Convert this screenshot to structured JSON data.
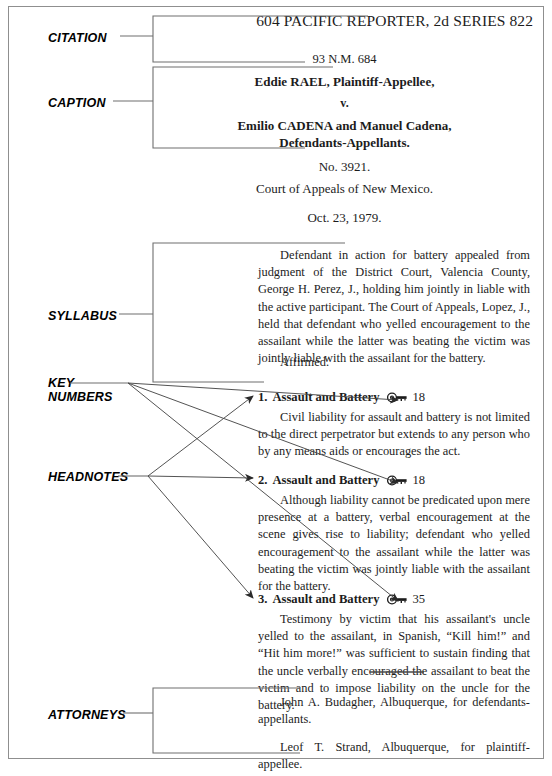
{
  "annotations": [
    {
      "id": "citation",
      "label": "CITATION",
      "x": 48,
      "y": 31
    },
    {
      "id": "caption",
      "label": "CAPTION",
      "x": 48,
      "y": 96
    },
    {
      "id": "syllabus",
      "label": "SYLLABUS",
      "x": 48,
      "y": 309
    },
    {
      "id": "key-numbers",
      "label": "KEY\nNUMBERS",
      "x": 48,
      "y": 376
    },
    {
      "id": "headnotes",
      "label": "HEADNOTES",
      "x": 48,
      "y": 470
    },
    {
      "id": "attorneys",
      "label": "ATTORNEYS",
      "x": 48,
      "y": 708
    }
  ],
  "citation": {
    "running_head": "604 PACIFIC REPORTER, 2d SERIES  822",
    "reporter_volume": "604",
    "reporter_name": "PACIFIC REPORTER, 2d SERIES",
    "page_number": "822",
    "parallel_cite": "93 N.M. 684"
  },
  "caption": {
    "party_appellee": "Eddie RAEL, Plaintiff-Appellee,",
    "versus": "v.",
    "party_appellants_line1": "Emilio CADENA and Manuel Cadena,",
    "party_appellants_line2": "Defendants-Appellants.",
    "docket_number": "No. 3921.",
    "court": "Court of Appeals of New Mexico.",
    "decided_date": "Oct. 23, 1979."
  },
  "syllabus": {
    "text": "Defendant in action for battery appealed from judgment of the District Court, Valencia County, George H. Perez, J., holding him jointly in liable with the active participant. The Court of Appeals, Lopez, J., held that defendant who yelled encouragement to the assailant while the latter was beating the victim was jointly liable with the assailant for the battery.",
    "disposition": "Affirmed."
  },
  "headnotes": [
    {
      "number": "1.",
      "topic": "Assault and Battery",
      "key_icon": "key-icon",
      "key_number": "18",
      "text": "Civil liability for assault and battery is not limited to the direct perpetrator but extends to any person who by any means aids or encourages the act."
    },
    {
      "number": "2.",
      "topic": "Assault and Battery",
      "key_icon": "key-icon",
      "key_number": "18",
      "text": "Although liability cannot be predicated upon mere presence at a battery, verbal encouragement at the scene gives rise to liability; defendant who yelled encouragement to the assailant while the latter was beating the victim was jointly liable with the assailant for the battery."
    },
    {
      "number": "3.",
      "topic": "Assault and Battery",
      "key_icon": "key-icon",
      "key_number": "35",
      "text": "Testimony by victim that his assailant's uncle yelled to the assailant, in Spanish, “Kill him!” and “Hit him more!” was sufficient to sustain finding that the uncle verbally encouraged the assailant to beat the victim and to impose liability on the uncle for the battery."
    }
  ],
  "attorneys": {
    "for_appellants": "John A. Budagher, Albuquerque, for defendants-appellants.",
    "for_appellee": "Leof T. Strand, Albuquerque, for plaintiff-appellee."
  },
  "colors": {
    "ink": "#1c1c1c",
    "rule": "#6f6f6f",
    "frame": "#8f8f8f",
    "label": "#000000"
  }
}
